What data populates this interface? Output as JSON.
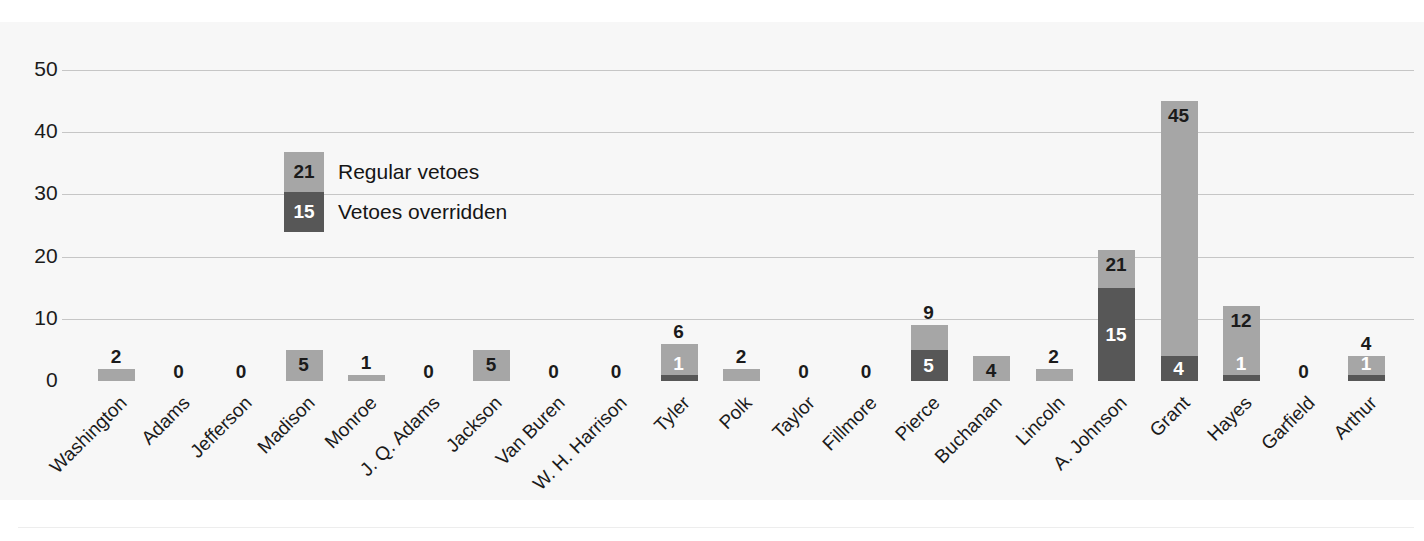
{
  "chart_data": {
    "type": "bar",
    "stacked": true,
    "title": "",
    "xlabel": "",
    "ylabel": "",
    "ylim": [
      0,
      50
    ],
    "yticks": [
      "0",
      "10",
      "20",
      "30",
      "40",
      "50"
    ],
    "grid": true,
    "legend_position": "inside-upper-left",
    "categories": [
      "Washington",
      "Adams",
      "Jefferson",
      "Madison",
      "Monroe",
      "J. Q. Adams",
      "Jackson",
      "Van Buren",
      "W. H. Harrison",
      "Tyler",
      "Polk",
      "Taylor",
      "Fillmore",
      "Pierce",
      "Buchanan",
      "Lincoln",
      "A. Johnson",
      "Grant",
      "Hayes",
      "Garfield",
      "Arthur"
    ],
    "series": [
      {
        "name": "Regular vetoes",
        "color": "#a6a6a6",
        "values": [
          2,
          0,
          0,
          5,
          1,
          0,
          5,
          0,
          0,
          6,
          2,
          0,
          0,
          9,
          4,
          2,
          21,
          45,
          12,
          0,
          4
        ]
      },
      {
        "name": "Vetoes overridden",
        "color": "#575757",
        "values": [
          0,
          0,
          0,
          0,
          0,
          0,
          0,
          0,
          0,
          1,
          0,
          0,
          0,
          5,
          0,
          0,
          15,
          4,
          1,
          0,
          1
        ]
      }
    ],
    "point_labels": [
      {
        "category": "Washington",
        "total": "2",
        "total_pos": "above",
        "override": null,
        "override_pos": null
      },
      {
        "category": "Adams",
        "total": "0",
        "total_pos": "zero",
        "override": null,
        "override_pos": null
      },
      {
        "category": "Jefferson",
        "total": "0",
        "total_pos": "zero",
        "override": null,
        "override_pos": null
      },
      {
        "category": "Madison",
        "total": "5",
        "total_pos": "inside",
        "override": null,
        "override_pos": null
      },
      {
        "category": "Monroe",
        "total": "1",
        "total_pos": "above",
        "override": null,
        "override_pos": null
      },
      {
        "category": "J. Q. Adams",
        "total": "0",
        "total_pos": "zero",
        "override": null,
        "override_pos": null
      },
      {
        "category": "Jackson",
        "total": "5",
        "total_pos": "inside",
        "override": null,
        "override_pos": null
      },
      {
        "category": "Van Buren",
        "total": "0",
        "total_pos": "zero",
        "override": null,
        "override_pos": null
      },
      {
        "category": "W. H. Harrison",
        "total": "0",
        "total_pos": "zero",
        "override": null,
        "override_pos": null
      },
      {
        "category": "Tyler",
        "total": "6",
        "total_pos": "above",
        "override": "1",
        "override_pos": "inside-light"
      },
      {
        "category": "Polk",
        "total": "2",
        "total_pos": "above",
        "override": null,
        "override_pos": null
      },
      {
        "category": "Taylor",
        "total": "0",
        "total_pos": "zero",
        "override": null,
        "override_pos": null
      },
      {
        "category": "Fillmore",
        "total": "0",
        "total_pos": "zero",
        "override": null,
        "override_pos": null
      },
      {
        "category": "Pierce",
        "total": "9",
        "total_pos": "above",
        "override": "5",
        "override_pos": "inside-dark"
      },
      {
        "category": "Buchanan",
        "total": "4",
        "total_pos": "inside",
        "override": null,
        "override_pos": null
      },
      {
        "category": "Lincoln",
        "total": "2",
        "total_pos": "above",
        "override": null,
        "override_pos": null
      },
      {
        "category": "A. Johnson",
        "total": "21",
        "total_pos": "inside",
        "override": "15",
        "override_pos": "inside-dark"
      },
      {
        "category": "Grant",
        "total": "45",
        "total_pos": "inside",
        "override": "4",
        "override_pos": "inside-dark"
      },
      {
        "category": "Hayes",
        "total": "12",
        "total_pos": "inside",
        "override": "1",
        "override_pos": "inside-light"
      },
      {
        "category": "Garfield",
        "total": "0",
        "total_pos": "zero",
        "override": null,
        "override_pos": null
      },
      {
        "category": "Arthur",
        "total": "4",
        "total_pos": "above",
        "override": "1",
        "override_pos": "inside-light"
      }
    ]
  },
  "legend": {
    "items": [
      {
        "value": "21",
        "label": "Regular vetoes"
      },
      {
        "value": "15",
        "label": "Vetoes overridden"
      }
    ]
  },
  "colors": {
    "regular": "#a6a6a6",
    "override": "#575757",
    "grid": "#c6c6c6",
    "text": "#1b1b1b",
    "panel": "#f7f7f7"
  }
}
